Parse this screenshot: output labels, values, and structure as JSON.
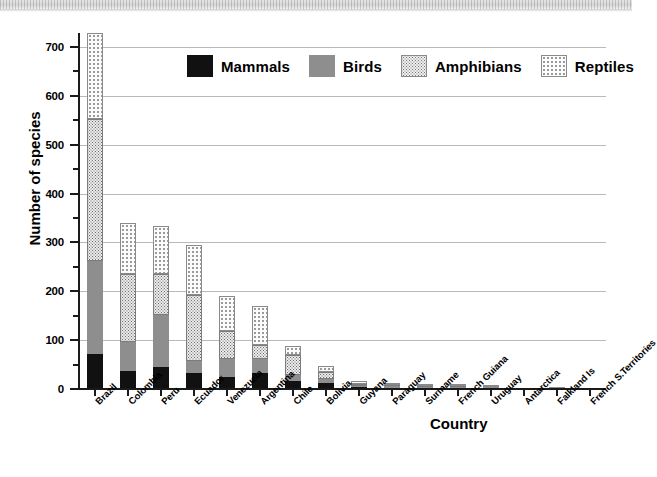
{
  "chart_data": {
    "type": "bar",
    "subtype": "stacked",
    "title": "",
    "xlabel": "Country",
    "ylabel": "Number of species",
    "ylim": [
      0,
      740
    ],
    "yticks": [
      0,
      100,
      200,
      300,
      400,
      500,
      600,
      700
    ],
    "ytick_labels": [
      "0",
      "100",
      "200",
      "300",
      "400",
      "500",
      "600",
      "700"
    ],
    "yminor_ticks": [
      50,
      150,
      250,
      350,
      450,
      550,
      650
    ],
    "grid": "horizontal-major",
    "legend_position": "upper-center",
    "categories": [
      "Brazil",
      "Colombia",
      "Peru",
      "Ecuador",
      "Venezuela",
      "Argentina",
      "Chile",
      "Bolivia",
      "Guyana",
      "Paraguay",
      "Suriname",
      "French Guiana",
      "Uruguay",
      "Antarctica",
      "Falkland Is",
      "French S.Territories"
    ],
    "series": [
      {
        "name": "Mammals",
        "color": "#111111",
        "pattern": "solid-black",
        "values": [
          71,
          36,
          46,
          33,
          25,
          32,
          16,
          12,
          4,
          3,
          3,
          2,
          2,
          0,
          0,
          0
        ]
      },
      {
        "name": "Birds",
        "color": "#8e8e8e",
        "pattern": "solid-gray",
        "values": [
          191,
          61,
          105,
          24,
          37,
          29,
          12,
          9,
          3,
          3,
          2,
          2,
          2,
          0,
          1,
          0
        ]
      },
      {
        "name": "Amphibians",
        "color": "#eceaea",
        "pattern": "dense-stipple",
        "values": [
          290,
          139,
          84,
          136,
          57,
          30,
          42,
          13,
          3,
          2,
          2,
          2,
          1,
          0,
          0,
          0
        ]
      },
      {
        "name": "Reptiles",
        "color": "#fbfbfb",
        "pattern": "sparse-stipple",
        "values": [
          176,
          104,
          99,
          102,
          71,
          78,
          18,
          14,
          6,
          4,
          4,
          3,
          2,
          0,
          0,
          0
        ]
      }
    ],
    "totals": [
      728,
      340,
      334,
      295,
      190,
      169,
      88,
      48,
      16,
      12,
      11,
      9,
      7,
      0,
      1,
      0
    ]
  },
  "legend": {
    "items": [
      {
        "label": "Mammals",
        "swatch": "mammals-swatch"
      },
      {
        "label": "Birds",
        "swatch": "birds-swatch"
      },
      {
        "label": "Amphibians",
        "swatch": "amphibians-swatch"
      },
      {
        "label": "Reptiles",
        "swatch": "reptiles-swatch"
      }
    ]
  },
  "axes": {
    "y_title": "Number of species",
    "x_title": "Country"
  }
}
